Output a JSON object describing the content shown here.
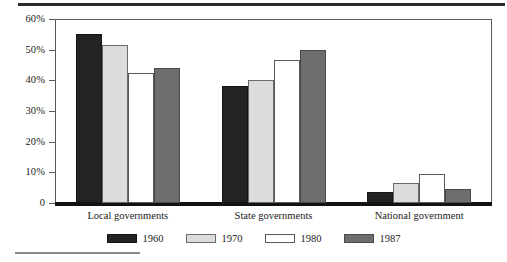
{
  "figure": {
    "top_rule": true,
    "bottom_footnote_rule": true
  },
  "chart_data": {
    "type": "bar",
    "title": "",
    "subtitle": "",
    "xlabel": "",
    "ylabel": "",
    "categories": [
      "Local governments",
      "State governments",
      "National government"
    ],
    "series": [
      {
        "name": "1960",
        "color": "#232323",
        "values": [
          55.0,
          38.0,
          3.5
        ]
      },
      {
        "name": "1970",
        "color": "#dcdcdc",
        "values": [
          51.5,
          40.0,
          6.5
        ]
      },
      {
        "name": "1980",
        "color": "#ffffff",
        "values": [
          42.5,
          46.7,
          9.5
        ]
      },
      {
        "name": "1987",
        "color": "#6e6e6e",
        "values": [
          44.0,
          50.0,
          4.5
        ]
      }
    ],
    "ylim": [
      0,
      60
    ],
    "yticks": [
      0,
      10,
      20,
      30,
      40,
      50,
      60
    ],
    "ytick_labels": [
      "0",
      "10%",
      "20%",
      "30%",
      "40%",
      "50%",
      "60%"
    ],
    "grid": false,
    "legend_position": "bottom",
    "legend_entries": [
      "1960",
      "1970",
      "1980",
      "1987"
    ]
  }
}
